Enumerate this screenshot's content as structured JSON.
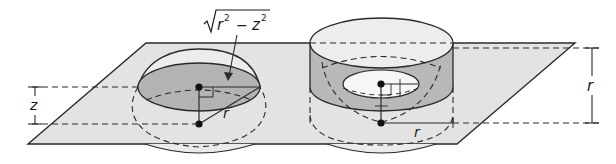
{
  "figure": {
    "colors": {
      "plane_fill": "#e3e3e3",
      "disk_fill": "#b3b3b3",
      "annulus_fill": "#b8b8b8",
      "cylinder_top_fill": "#ededed",
      "inner_hole_fill": "#f6f6f6",
      "stroke": "#2a2a2a",
      "background": "#ffffff"
    },
    "left": {
      "formula_label": "√r² − z²",
      "formula_radicand_r": "r",
      "formula_exp1": "2",
      "formula_minus": "−",
      "formula_z": "z",
      "formula_exp2": "2",
      "radius_label": "r",
      "height_label": "z"
    },
    "right": {
      "radius_label": "r",
      "height_label": "r"
    }
  }
}
